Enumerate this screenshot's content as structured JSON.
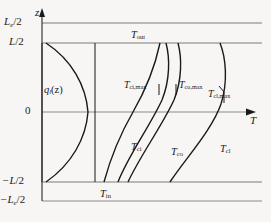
{
  "figure": {
    "kind": "axial-temperature-profile"
  },
  "axes": {
    "vertical": {
      "symbol": "z",
      "name": "axial-position"
    },
    "horizontal": {
      "symbol": "T",
      "name": "temperature"
    },
    "y_ticks": [
      {
        "id": "le-half-top",
        "text": "L",
        "sub": "e",
        "tail": "/2"
      },
      {
        "id": "l-half-top",
        "text": "L",
        "sub": "",
        "tail": "/2"
      },
      {
        "id": "origin",
        "text": "0",
        "sub": "",
        "tail": ""
      },
      {
        "id": "l-half-bot",
        "text": "−L",
        "sub": "",
        "tail": "/2"
      },
      {
        "id": "le-half-bot",
        "text": "−L",
        "sub": "e",
        "tail": "/2"
      }
    ]
  },
  "curves": [
    {
      "id": "q-l",
      "label": "q",
      "sub": "l",
      "tail": "(z)",
      "meaning": "linear-heat-rate-cosine"
    },
    {
      "id": "t-ci",
      "label": "T",
      "sub": "ci",
      "tail": "",
      "meaning": "coolant-inner-temperature"
    },
    {
      "id": "t-co",
      "label": "T",
      "sub": "co",
      "tail": "",
      "meaning": "cladding-outer-temperature"
    },
    {
      "id": "t-cl",
      "label": "T",
      "sub": "cl",
      "tail": "",
      "meaning": "cladding-inner-temperature"
    }
  ],
  "labels": {
    "t_out": {
      "base": "T",
      "sub": "out"
    },
    "t_in": {
      "base": "T",
      "sub": "in"
    },
    "t_ci_max": {
      "base": "T",
      "sub": "ci,max"
    },
    "t_co_max": {
      "base": "T",
      "sub": "co,max"
    },
    "t_cl_max": {
      "base": "T",
      "sub": "cl,max"
    },
    "q_l_z": {
      "base": "q",
      "sub": "l",
      "tail": "(z)"
    },
    "t_ci": {
      "base": "T",
      "sub": "ci"
    },
    "t_co": {
      "base": "T",
      "sub": "co"
    },
    "t_cl": {
      "base": "T",
      "sub": "cl"
    },
    "z_axis": {
      "base": "z"
    },
    "t_axis": {
      "base": "T"
    }
  },
  "colors": {
    "curve": "#1a1a1a",
    "axis": "#6f6f6f",
    "background": "#f7f6f4"
  }
}
